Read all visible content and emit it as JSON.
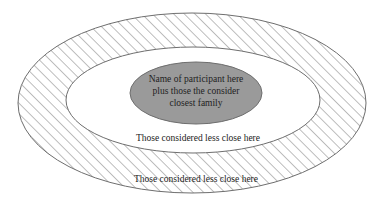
{
  "diagram": {
    "type": "concentric-ellipses",
    "colors": {
      "background": "#ffffff",
      "outline": "#6e6e6e",
      "hatch": "#6e6e6e",
      "core_fill": "#9a9a9a",
      "text": "#222222"
    },
    "core": {
      "lines": [
        "Name of participant here",
        "plus those the consider",
        "closest family"
      ]
    },
    "middle_ring": {
      "label": "Those considered less close here"
    },
    "outer_ring": {
      "label": "Those considered less close here",
      "pattern": "diagonal-hatch"
    }
  }
}
